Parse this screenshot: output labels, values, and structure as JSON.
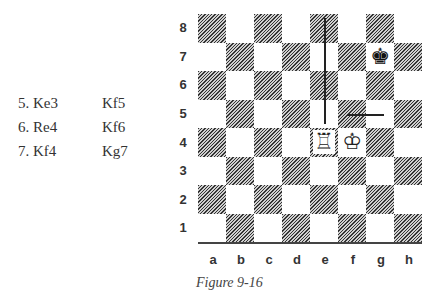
{
  "moves": [
    {
      "number": "5.",
      "white": "Ke3",
      "white_label": "5. Ke3",
      "black": "Kf5"
    },
    {
      "number": "6.",
      "white": "Re4",
      "white_label": "6. Re4",
      "black": "Kf6"
    },
    {
      "number": "7.",
      "white": "Kf4",
      "white_label": "7. Kf4",
      "black": "Kg7"
    }
  ],
  "board": {
    "ranks": [
      "8",
      "7",
      "6",
      "5",
      "4",
      "3",
      "2",
      "1"
    ],
    "files": [
      "a",
      "b",
      "c",
      "d",
      "e",
      "f",
      "g",
      "h"
    ],
    "pieces": [
      {
        "square": "g7",
        "piece": "black-king",
        "glyph": "♚"
      },
      {
        "square": "e4",
        "piece": "white-rook",
        "glyph": "♖"
      },
      {
        "square": "f4",
        "piece": "white-king",
        "glyph": "♔"
      }
    ],
    "arrows": [
      {
        "type": "vertical-line",
        "file": "e",
        "from_rank": "8",
        "to_rank": "5"
      },
      {
        "type": "horizontal-line",
        "rank": "5",
        "from_file": "f",
        "to_file": "g"
      }
    ]
  },
  "caption": "Figure 9-16"
}
